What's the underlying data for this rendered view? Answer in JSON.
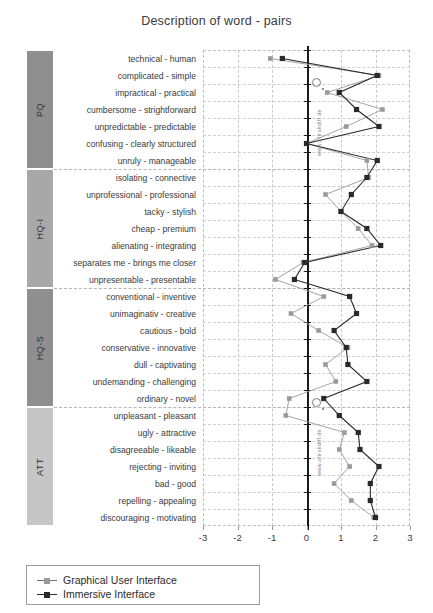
{
  "chart_data": {
    "type": "line",
    "title": "Description of word - pairs",
    "orientation": "horizontal",
    "xlabel": "",
    "ylabel": "",
    "xlim": [
      -3,
      3
    ],
    "xticks": [
      -3,
      -2,
      -1,
      0,
      1,
      2,
      3
    ],
    "xtick_labels": [
      "-3",
      "-2",
      "-1",
      "0",
      "1",
      "2",
      "3"
    ],
    "grid": true,
    "legend_position": "bottom-left",
    "categories": [
      "technical - human",
      "complicated - simple",
      "impractical - practical",
      "cumbersome - strightforward",
      "unpredictable - predictable",
      "confusing - clearly structured",
      "unruly - manageable",
      "isolating - connective",
      "unprofessional - professional",
      "tacky - stylish",
      "cheap - premium",
      "alienating - integrating",
      "separates me - brings me closer",
      "unpresentable - presentable",
      "conventional - inventive",
      "unimaginativ - creative",
      "cautious - bold",
      "conservative - innovative",
      "dull - captivating",
      "undemanding - challenging",
      "ordinary - novel",
      "unpleasant - pleasant",
      "ugly - attractive",
      "disagreeable - likeable",
      "rejecting - inviting",
      "bad - good",
      "repelling - appealing",
      "discouraging - motivating"
    ],
    "groups": [
      {
        "label": "PQ",
        "start": 0,
        "end": 6,
        "color": "#8f8f8f"
      },
      {
        "label": "HQ-I",
        "start": 7,
        "end": 13,
        "color": "#a8a8a8"
      },
      {
        "label": "HQ-S",
        "start": 14,
        "end": 20,
        "color": "#8f8f8f"
      },
      {
        "label": "ATT",
        "start": 21,
        "end": 27,
        "color": "#c6c6c6"
      }
    ],
    "series": [
      {
        "name": "Graphical User Interface",
        "color": "#9a9a9a",
        "marker": "square",
        "values": [
          -1.05,
          2.1,
          0.6,
          2.2,
          1.15,
          0.0,
          1.75,
          1.8,
          0.55,
          1.0,
          1.5,
          1.9,
          -0.1,
          -0.9,
          0.5,
          -0.45,
          0.35,
          1.2,
          0.55,
          0.85,
          -0.5,
          -0.6,
          1.1,
          0.95,
          1.25,
          0.8,
          1.3,
          1.95
        ]
      },
      {
        "name": "Immersive Interface",
        "color": "#2a2a2a",
        "marker": "square",
        "values": [
          -0.7,
          2.05,
          0.95,
          1.45,
          2.1,
          0.0,
          2.05,
          1.75,
          1.3,
          1.0,
          1.75,
          2.15,
          -0.05,
          -0.35,
          1.25,
          1.45,
          0.8,
          1.15,
          1.2,
          1.75,
          0.5,
          0.95,
          1.5,
          1.55,
          2.1,
          1.85,
          1.85,
          2.0
        ]
      }
    ]
  },
  "legend": {
    "items": [
      {
        "label": "Graphical User Interface",
        "color": "#9a9a9a"
      },
      {
        "label": "Immersive Interface",
        "color": "#2a2a2a"
      }
    ]
  },
  "watermarks": {
    "vertical_text": "www.attrakdiff.de",
    "vertical_text_2": "www.attrakdiff.de"
  }
}
